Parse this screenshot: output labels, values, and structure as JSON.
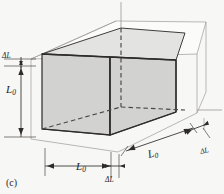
{
  "figure": {
    "panel_label": "(c)",
    "caption_tag": "c",
    "colors": {
      "background": "#f7f7f5",
      "solid_face_fill": "#d0d0d0",
      "solid_edge": "#3a3a3a",
      "wireframe_edge": "#9a9a9a",
      "hidden_edge": "#55524f",
      "dimension_line": "#3a3a3a",
      "text": "#23211f"
    },
    "labels": {
      "height_original": {
        "symbol": "L",
        "subscript": "0",
        "text": "L0",
        "axis": "vertical-left"
      },
      "height_increase": {
        "symbol": "ΔL",
        "text": "ΔL",
        "axis": "vertical-left"
      },
      "width_original": {
        "symbol": "L",
        "subscript": "0",
        "text": "L0",
        "axis": "horizontal-bottom"
      },
      "width_increase": {
        "symbol": "ΔL",
        "text": "ΔL",
        "axis": "horizontal-bottom"
      },
      "depth_original": {
        "symbol": "L",
        "subscript": "0",
        "text": "L0",
        "axis": "diagonal-depth"
      },
      "depth_increase": {
        "symbol": "ΔL",
        "text": "ΔL",
        "axis": "diagonal-depth"
      }
    },
    "symbols": {
      "L": "L",
      "zero_subscript": "0",
      "delta_L": "ΔL"
    },
    "geometry": {
      "solid_box": {
        "front_face": "shaded gray quadrilateral",
        "right_face": "shaded gray quadrilateral",
        "hidden_edges": "dashed"
      },
      "expanded_box": {
        "style": "thin outline wireframe offset outward by ΔL on each axis"
      }
    },
    "dimension_marks": {
      "arrow_style": "solid filled triangles",
      "extension_line_style": "thin solid"
    }
  }
}
